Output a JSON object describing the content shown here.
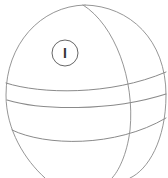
{
  "figure": {
    "label": {
      "text": "I",
      "shape": "circle"
    },
    "colors": {
      "stroke": "#8a8a8a",
      "label_stroke": "#555555",
      "background": "#ffffff"
    }
  }
}
